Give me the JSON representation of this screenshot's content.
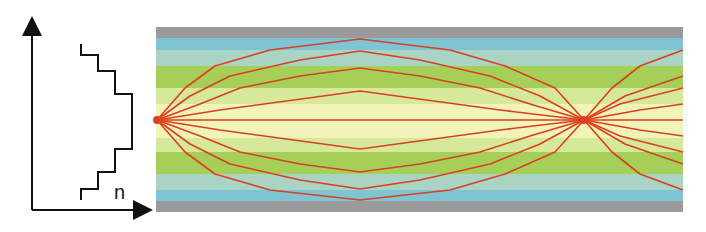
{
  "profile": {
    "axis_label": "n",
    "step_profile_points": [
      [
        81,
        44
      ],
      [
        81,
        55
      ],
      [
        98,
        55
      ],
      [
        98,
        71
      ],
      [
        115,
        71
      ],
      [
        115,
        94
      ],
      [
        132,
        94
      ],
      [
        132,
        149
      ],
      [
        115,
        149
      ],
      [
        115,
        172
      ],
      [
        98,
        172
      ],
      [
        98,
        189
      ],
      [
        81,
        189
      ],
      [
        81,
        200
      ]
    ]
  },
  "fiber": {
    "x_start": 156,
    "x_end": 683,
    "bands": [
      {
        "name": "cladding-top",
        "y": 27,
        "h": 11,
        "color": "#9a9a9a"
      },
      {
        "name": "core-layer-1-top",
        "y": 38,
        "h": 12,
        "color": "#7ec4d2"
      },
      {
        "name": "core-layer-2-top",
        "y": 50,
        "h": 16,
        "color": "#a9d3c2"
      },
      {
        "name": "core-layer-3-top",
        "y": 66,
        "h": 22,
        "color": "#a6cf5a"
      },
      {
        "name": "core-layer-4-top",
        "y": 88,
        "h": 16,
        "color": "#d6e89a"
      },
      {
        "name": "core-center",
        "y": 104,
        "h": 34,
        "color": "#f1f3b8"
      },
      {
        "name": "core-layer-4-bottom",
        "y": 138,
        "h": 14,
        "color": "#d6e89a"
      },
      {
        "name": "core-layer-3-bottom",
        "y": 152,
        "h": 22,
        "color": "#a6cf5a"
      },
      {
        "name": "core-layer-2-bottom",
        "y": 174,
        "h": 16,
        "color": "#a9d3c2"
      },
      {
        "name": "core-layer-1-bottom",
        "y": 190,
        "h": 11,
        "color": "#7ec4d2"
      },
      {
        "name": "cladding-bottom",
        "y": 201,
        "h": 11,
        "color": "#9a9a9a"
      }
    ],
    "source_point": [
      157,
      120
    ],
    "focus_point": [
      584,
      120
    ],
    "ray_color": "#d9401f",
    "rays": [
      "157,120 185,88 215,66 270,50 360,39 450,50 505,66 555,88 584,120 612,88 640,66 683,50",
      "157,120 190,96 230,76 300,60 360,51 420,60 490,76 540,96 584,120 625,96 683,76",
      "157,120 200,104 240,88 300,76 360,68 420,76 480,88 530,104 584,120 620,104 683,88",
      "157,120 220,110 360,91 500,110 584,120 640,110 683,104",
      "157,120 360,120 584,120 683,120",
      "157,120 220,130 360,149 500,130 584,120 640,130 683,136",
      "157,120 200,136 240,152 300,164 360,172 420,164 480,152 530,136 584,120 620,136 683,152",
      "157,120 190,144 230,164 300,180 360,189 420,180 490,164 540,144 584,120 625,144 683,164",
      "157,120 185,152 215,174 270,190 360,200 450,190 505,174 555,152 584,120 612,152 640,174 683,190"
    ]
  }
}
